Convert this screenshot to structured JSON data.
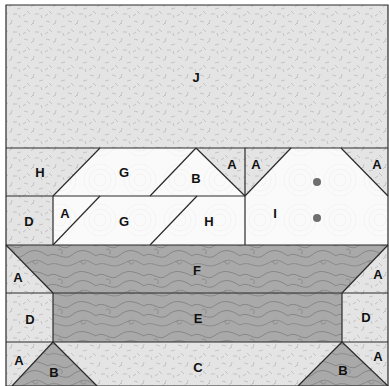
{
  "diagram": {
    "colors": {
      "light_fabric": "#e4e4e4",
      "light_fleck": "#b4b4b4",
      "white_fabric": "#fafafa",
      "white_swirl": "#ececec",
      "dark_fabric": "#a9a9a9",
      "dark_swirl": "#7d7d7d",
      "outline": "#2a2a2a",
      "dot": "#6e6e6e"
    },
    "pieces": [
      {
        "id": "J",
        "label": "J",
        "fabric": "light",
        "points": "6,5 388,5 388,148 6,148",
        "lx": 196,
        "ly": 77
      },
      {
        "id": "H1",
        "label": "H",
        "fabric": "light",
        "points": "6,148 100,148 53,196 6,196",
        "lx": 40,
        "ly": 172
      },
      {
        "id": "G1",
        "label": "G",
        "fabric": "white",
        "points": "100,148 196,148 150,196 53,196",
        "lx": 124,
        "ly": 172
      },
      {
        "id": "B1",
        "label": "B",
        "fabric": "white",
        "points": "196,148 245,196 150,196",
        "lx": 196,
        "ly": 178
      },
      {
        "id": "A1",
        "label": "A",
        "fabric": "light",
        "points": "196,148 245,148 245,196",
        "lx": 232,
        "ly": 164
      },
      {
        "id": "A2",
        "label": "A",
        "fabric": "light",
        "points": "245,148 291,148 245,196",
        "lx": 256,
        "ly": 164
      },
      {
        "id": "I",
        "label": "I",
        "fabric": "white",
        "points": "291,148 341,148 388,196 388,245 245,245 245,196",
        "lx": 275,
        "ly": 213
      },
      {
        "id": "A3",
        "label": "A",
        "fabric": "light",
        "points": "341,148 388,148 388,196",
        "lx": 377,
        "ly": 164
      },
      {
        "id": "D1",
        "label": "D",
        "fabric": "light",
        "points": "6,196 53,196 53,245 6,245",
        "lx": 29,
        "ly": 221
      },
      {
        "id": "A4",
        "label": "A",
        "fabric": "white",
        "points": "53,196 100,196 53,245",
        "lx": 65,
        "ly": 213
      },
      {
        "id": "G2",
        "label": "G",
        "fabric": "white",
        "points": "100,196 197,196 150,245 53,245",
        "lx": 124,
        "ly": 221
      },
      {
        "id": "H2",
        "label": "H",
        "fabric": "white",
        "points": "197,196 245,196 245,245 150,245",
        "lx": 209,
        "ly": 221
      },
      {
        "id": "A5",
        "label": "A",
        "fabric": "light",
        "points": "6,245 53,293 6,293",
        "lx": 18,
        "ly": 277
      },
      {
        "id": "F",
        "label": "F",
        "fabric": "dark",
        "points": "6,245 388,245 342,293 53,293",
        "lx": 197,
        "ly": 270
      },
      {
        "id": "A6",
        "label": "A",
        "fabric": "light",
        "points": "388,245 388,293 342,293",
        "lx": 378,
        "ly": 274
      },
      {
        "id": "D2",
        "label": "D",
        "fabric": "light",
        "points": "6,293 53,293 53,342 6,342",
        "lx": 30,
        "ly": 319
      },
      {
        "id": "E",
        "label": "E",
        "fabric": "dark",
        "points": "53,293 342,293 342,342 53,342",
        "lx": 198,
        "ly": 318
      },
      {
        "id": "D3",
        "label": "D",
        "fabric": "light",
        "points": "342,293 388,293 388,342 342,342",
        "lx": 366,
        "ly": 317
      },
      {
        "id": "A7",
        "label": "A",
        "fabric": "light",
        "points": "6,342 53,342 12,386 6,386",
        "lx": 19,
        "ly": 360
      },
      {
        "id": "B2",
        "label": "B",
        "fabric": "dark",
        "points": "53,342 97,386 12,386",
        "lx": 54,
        "ly": 372
      },
      {
        "id": "C",
        "label": "C",
        "fabric": "light",
        "points": "53,342 342,342 298,386 97,386",
        "lx": 198,
        "ly": 367
      },
      {
        "id": "B3",
        "label": "B",
        "fabric": "dark",
        "points": "342,342 388,386 298,386",
        "lx": 343,
        "ly": 370
      },
      {
        "id": "A8",
        "label": "A",
        "fabric": "light",
        "points": "342,342 388,342 388,386",
        "lx": 378,
        "ly": 356
      }
    ],
    "dots": [
      {
        "cx": 317,
        "cy": 182,
        "r": 4
      },
      {
        "cx": 317,
        "cy": 218,
        "r": 4
      }
    ],
    "seams": [
      "6,148 388,148",
      "6,196 245,196",
      "6,245 388,245",
      "6,293 388,293",
      "6,342 388,342",
      "100,148 53,196",
      "196,148 150,196",
      "196,148 245,196",
      "245,148 245,245",
      "291,148 245,196",
      "341,148 388,196",
      "53,196 53,245",
      "100,196 53,245",
      "197,196 150,245",
      "6,245 53,293",
      "388,245 342,293",
      "53,293 53,342",
      "342,293 342,342",
      "53,342 12,386",
      "53,342 97,386",
      "342,342 298,386",
      "342,342 388,386"
    ],
    "border": "6,5 388,5 388,386 6,386"
  }
}
